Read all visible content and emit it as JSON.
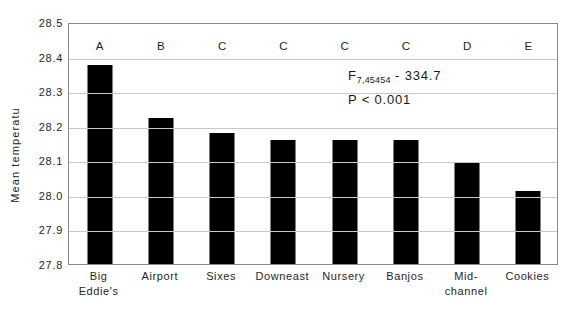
{
  "chart_data": {
    "type": "bar",
    "title": "",
    "xlabel": "",
    "ylabel": "Mean temperatu",
    "ylim": [
      27.8,
      28.5
    ],
    "ytick_step": 0.1,
    "yticks": [
      "28.5",
      "28.4",
      "28.3",
      "28.2",
      "28.1",
      "28.0",
      "27.9",
      "27.8"
    ],
    "grid": true,
    "legend": "none",
    "categories": [
      "Big Eddie's",
      "Airport",
      "Sixes",
      "Downeast",
      "Nursery",
      "Banjos",
      "Mid-channel",
      "Cookies"
    ],
    "values": [
      28.375,
      28.222,
      28.18,
      28.158,
      28.158,
      28.159,
      28.093,
      28.012
    ],
    "errors": [
      0.005,
      0.002,
      0.003,
      0.002,
      0.002,
      0.003,
      0.003,
      0.003
    ],
    "group_letters": [
      "A",
      "B",
      "C",
      "C",
      "C",
      "C",
      "D",
      "E"
    ],
    "bar_color": "#000000",
    "annotation": {
      "f_symbol": "F",
      "f_subscript": "7,45454",
      "f_separator": "-",
      "f_value": "334.7",
      "p_text": "P < 0.001"
    }
  },
  "axis": {
    "y_title": "Mean temperatu"
  },
  "xlabels": [
    {
      "line1": "Big Eddie's",
      "line2": ""
    },
    {
      "line1": "Airport",
      "line2": ""
    },
    {
      "line1": "Sixes",
      "line2": ""
    },
    {
      "line1": "Downeast",
      "line2": ""
    },
    {
      "line1": "Nursery",
      "line2": ""
    },
    {
      "line1": "Banjos",
      "line2": ""
    },
    {
      "line1": "Mid-",
      "line2": "channel"
    },
    {
      "line1": "Cookies",
      "line2": ""
    }
  ]
}
